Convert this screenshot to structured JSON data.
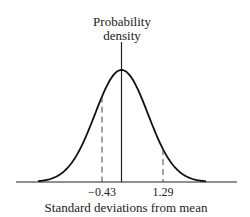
{
  "chart_data": {
    "type": "line",
    "title": "",
    "ylabel": "Probability density",
    "ylabel_lines": [
      "Probability",
      "density"
    ],
    "xlabel": "Standard deviations from mean",
    "curve": "standard normal probability density function",
    "annotations": [
      {
        "x": -0.43,
        "label": "−0.43",
        "style": "dashed"
      },
      {
        "x": 1.29,
        "label": "1.29",
        "style": "dashed"
      }
    ],
    "mean_line": {
      "x": 0,
      "style": "solid"
    },
    "grid": false,
    "legend": null
  }
}
